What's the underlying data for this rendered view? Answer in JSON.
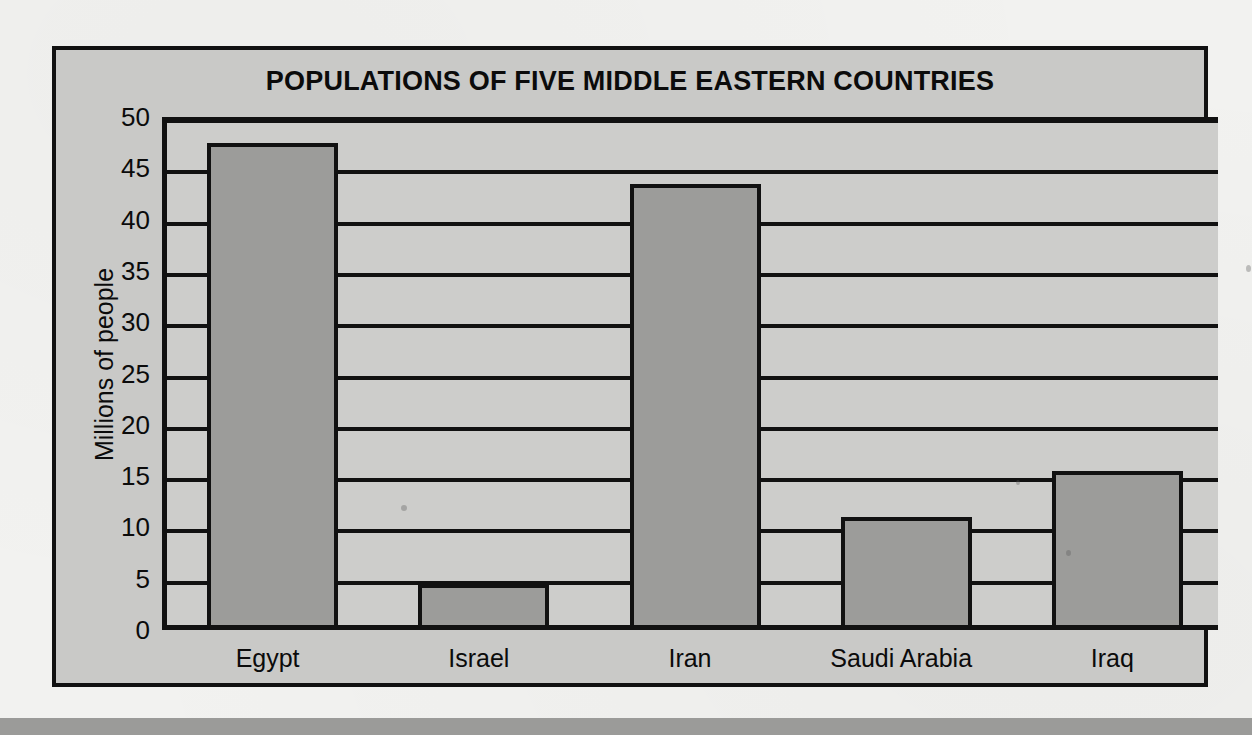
{
  "chart_data": {
    "type": "bar",
    "title": "POPULATIONS OF FIVE MIDDLE EASTERN COUNTRIES",
    "xlabel": "",
    "ylabel": "Millions of people",
    "categories": [
      "Egypt",
      "Israel",
      "Iran",
      "Saudi Arabia",
      "Iraq"
    ],
    "values": [
      47,
      4,
      43,
      10.5,
      15
    ],
    "series": [
      {
        "name": "Population",
        "values": [
          47,
          4,
          43,
          10.5,
          15
        ]
      }
    ],
    "ylim": [
      0,
      50
    ],
    "y_ticks": [
      0,
      5,
      10,
      15,
      20,
      25,
      30,
      35,
      40,
      45,
      50
    ],
    "y_tick_labels": [
      "0",
      "5",
      "10",
      "15",
      "20",
      "25",
      "30",
      "35",
      "40",
      "45",
      "50"
    ],
    "grid": true,
    "grid_axis": "y",
    "legend": false,
    "legend_position": "none",
    "bar_color": "#9c9c9a",
    "bar_edge_color": "#111111",
    "plot_background": "#cdcdcb",
    "panel_background": "#c9c9c7",
    "page_background": "#f2f2f0",
    "text_color": "#0b0b0b"
  }
}
